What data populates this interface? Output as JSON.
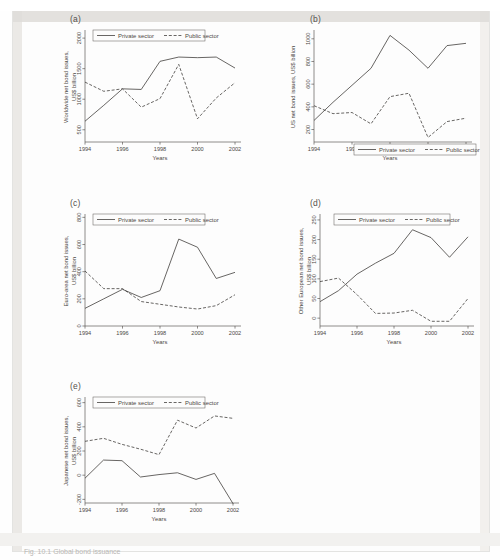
{
  "figure": {
    "caption": "Fig. 10.1   Global bond issuance",
    "legend": {
      "private": "Private sector",
      "public": "Public sector"
    },
    "x_axis_title": "Years",
    "x_tick_labels": [
      "1994",
      "1996",
      "1998",
      "2000",
      "2002"
    ],
    "years": [
      1994,
      1995,
      1996,
      1997,
      1998,
      1999,
      2000,
      2001,
      2002
    ]
  },
  "chart_data": [
    {
      "type": "line",
      "panel": "(a)",
      "title": "",
      "ylabel": "Worldwide net bond issues,\nUS$ billion",
      "ylabel_line1": "Worldwide net bond issues,",
      "ylabel_line2": "US$ billion",
      "xlabel": "Years",
      "x": [
        1994,
        1995,
        1996,
        1997,
        1998,
        1999,
        2000,
        2001,
        2002
      ],
      "xlim": [
        1994,
        2002
      ],
      "ylim": [
        300,
        2100
      ],
      "y_tick_labels": [
        "500",
        "1000",
        "1500",
        "2000"
      ],
      "y_ticks": [
        500,
        1000,
        1500,
        2000
      ],
      "grid": false,
      "legend_position": "top-left",
      "series": [
        {
          "name": "Private sector",
          "style": "solid",
          "values": [
            640,
            900,
            1170,
            1160,
            1620,
            1690,
            1680,
            1690,
            1510
          ]
        },
        {
          "name": "Public sector",
          "style": "dashed",
          "values": [
            1280,
            1130,
            1170,
            870,
            1010,
            1570,
            680,
            1020,
            1270
          ]
        }
      ]
    },
    {
      "type": "line",
      "panel": "(b)",
      "title": "",
      "ylabel": "US net bond issues, US$ billion",
      "ylabel_line1": "US net bond issues, US$ billion",
      "xlabel": "Years",
      "x": [
        1994,
        1995,
        1996,
        1997,
        1998,
        1999,
        2000,
        2001,
        2002
      ],
      "xlim": [
        1994,
        2002
      ],
      "ylim": [
        90,
        1060
      ],
      "y_tick_labels": [
        "200",
        "400",
        "600",
        "800",
        "1000"
      ],
      "y_ticks": [
        200,
        400,
        600,
        800,
        1000
      ],
      "grid": false,
      "legend_position": "bottom-center",
      "series": [
        {
          "name": "Private sector",
          "style": "solid",
          "values": [
            280,
            440,
            590,
            740,
            1030,
            900,
            740,
            940,
            960
          ]
        },
        {
          "name": "Public sector",
          "style": "dashed",
          "values": [
            410,
            340,
            350,
            250,
            490,
            520,
            130,
            270,
            300
          ]
        }
      ]
    },
    {
      "type": "line",
      "panel": "(c)",
      "title": "",
      "ylabel": "Euro-area net bond issues,\nUS$ billion",
      "ylabel_line1": "Euro-area net bond issues,",
      "ylabel_line2": "US$ billion",
      "xlabel": "Years",
      "x": [
        1994,
        1995,
        1996,
        1997,
        1998,
        1999,
        2000,
        2001,
        2002
      ],
      "xlim": [
        1994,
        2002
      ],
      "ylim": [
        0,
        810
      ],
      "y_tick_labels": [
        "0",
        "200",
        "400",
        "600",
        "800"
      ],
      "y_ticks": [
        0,
        200,
        400,
        600,
        800
      ],
      "grid": false,
      "legend_position": "top-left",
      "series": [
        {
          "name": "Private sector",
          "style": "solid",
          "values": [
            130,
            200,
            270,
            210,
            260,
            640,
            580,
            350,
            395
          ]
        },
        {
          "name": "Public sector",
          "style": "dashed",
          "values": [
            405,
            275,
            275,
            180,
            160,
            140,
            125,
            150,
            230
          ]
        }
      ]
    },
    {
      "type": "line",
      "panel": "(d)",
      "title": "",
      "ylabel": "Other European net bond issues,\nUS$ billion",
      "ylabel_line1": "Other European net bond issues,",
      "ylabel_line2": "US$ billion",
      "xlabel": "Years",
      "x": [
        1994,
        1995,
        1996,
        1997,
        1998,
        1999,
        2000,
        2001,
        2002
      ],
      "xlim": [
        1994,
        2002
      ],
      "ylim": [
        -20,
        260
      ],
      "y_tick_labels": [
        "0",
        "50",
        "100",
        "150",
        "200",
        "250"
      ],
      "y_ticks": [
        0,
        50,
        100,
        150,
        200,
        250
      ],
      "grid": false,
      "legend_position": "top-center",
      "series": [
        {
          "name": "Private sector",
          "style": "solid",
          "values": [
            42,
            70,
            112,
            140,
            165,
            225,
            205,
            155,
            207
          ]
        },
        {
          "name": "Public sector",
          "style": "dashed",
          "values": [
            93,
            102,
            60,
            12,
            13,
            20,
            -8,
            -8,
            50
          ]
        }
      ]
    },
    {
      "type": "line",
      "panel": "(e)",
      "title": "",
      "ylabel": "Japanese net bond issues,\nUS$ billion",
      "ylabel_line1": "Japanese net bond issues,",
      "ylabel_line2": "US$ billion",
      "xlabel": "Years",
      "x": [
        1994,
        1995,
        1996,
        1997,
        1998,
        1999,
        2000,
        2001,
        2002
      ],
      "xlim": [
        1994,
        2002
      ],
      "ylim": [
        -230,
        630
      ],
      "y_tick_labels": [
        "-200",
        "0",
        "200",
        "400",
        "600"
      ],
      "y_ticks": [
        -200,
        0,
        200,
        400,
        600
      ],
      "grid": false,
      "legend_position": "top-left",
      "series": [
        {
          "name": "Private sector",
          "style": "solid",
          "values": [
            -25,
            125,
            120,
            -15,
            5,
            20,
            -35,
            15,
            -235
          ]
        },
        {
          "name": "Public sector",
          "style": "dashed",
          "values": [
            280,
            305,
            255,
            215,
            170,
            455,
            390,
            490,
            470
          ]
        }
      ]
    }
  ]
}
